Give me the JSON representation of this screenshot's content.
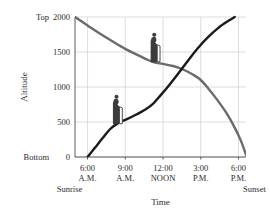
{
  "chart_data": {
    "type": "line",
    "title": "",
    "xlabel": "Time",
    "ylabel": "Altitude",
    "grid": true,
    "legend": "none",
    "xlim": [
      5.0,
      18.6
    ],
    "ylim": [
      0,
      2000
    ],
    "x_tick_values": [
      6,
      9,
      12,
      15,
      18
    ],
    "x_tick_labels": [
      "6:00",
      "9:00",
      "12:00",
      "3:00",
      "6:00"
    ],
    "x_tick_sublabels": [
      "A.M.",
      "A.M.",
      "NOON",
      "P.M.",
      "P.M."
    ],
    "y_tick_values": [
      0,
      500,
      1000,
      1500,
      2000
    ],
    "y_tick_labels": [
      "0",
      "500",
      "1000",
      "1500",
      "2000"
    ],
    "y_edge_labels": {
      "top": "Top",
      "bottom": "Bottom"
    },
    "annotations": [
      {
        "name": "sunrise",
        "text": "Sunrise",
        "x": 6.0
      },
      {
        "name": "sunset",
        "text": "Sunset",
        "x": 18.0
      }
    ],
    "series": [
      {
        "name": "descending-hiker",
        "label": "Descending hiker",
        "color": "#6b6b6b",
        "points": [
          [
            5.0,
            2000
          ],
          [
            6.0,
            1880
          ],
          [
            7.0,
            1760
          ],
          [
            8.0,
            1650
          ],
          [
            9.0,
            1545
          ],
          [
            10.0,
            1455
          ],
          [
            10.7,
            1395
          ],
          [
            11.3,
            1352
          ],
          [
            12.0,
            1330
          ],
          [
            12.8,
            1300
          ],
          [
            13.6,
            1250
          ],
          [
            14.4,
            1175
          ],
          [
            15.0,
            1100
          ],
          [
            15.6,
            980
          ],
          [
            16.3,
            820
          ],
          [
            17.0,
            640
          ],
          [
            17.6,
            455
          ],
          [
            18.2,
            230
          ],
          [
            18.6,
            30
          ]
        ]
      },
      {
        "name": "ascending-hiker",
        "label": "Ascending hiker",
        "color": "#1a1a1a",
        "points": [
          [
            6.0,
            0
          ],
          [
            6.6,
            135
          ],
          [
            7.2,
            270
          ],
          [
            7.8,
            400
          ],
          [
            8.4,
            480
          ],
          [
            9.0,
            530
          ],
          [
            9.8,
            600
          ],
          [
            10.6,
            680
          ],
          [
            11.2,
            760
          ],
          [
            11.8,
            880
          ],
          [
            12.5,
            1030
          ],
          [
            13.2,
            1190
          ],
          [
            14.0,
            1380
          ],
          [
            14.8,
            1560
          ],
          [
            15.6,
            1715
          ],
          [
            16.4,
            1845
          ],
          [
            17.2,
            1945
          ],
          [
            17.7,
            2000
          ]
        ]
      }
    ],
    "figures": [
      {
        "name": "hiker-lower",
        "x": 8.35,
        "y": 470,
        "facing": "right"
      },
      {
        "name": "hiker-upper",
        "x": 11.35,
        "y": 1355,
        "facing": "right"
      }
    ]
  }
}
